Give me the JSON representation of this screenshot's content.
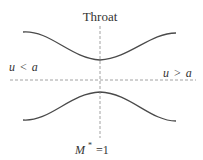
{
  "diagram": {
    "title_label": "Throat",
    "left_label": {
      "var": "u",
      "op": "<",
      "rhs": "a"
    },
    "right_label": {
      "var": "u",
      "op": ">",
      "rhs": "a"
    },
    "bottom_label": {
      "var": "M",
      "sup": "*",
      "eq": "=1"
    },
    "colors": {
      "curve": "#4a4a4a",
      "dashed": "#8a8a8a",
      "text": "#333333"
    }
  }
}
